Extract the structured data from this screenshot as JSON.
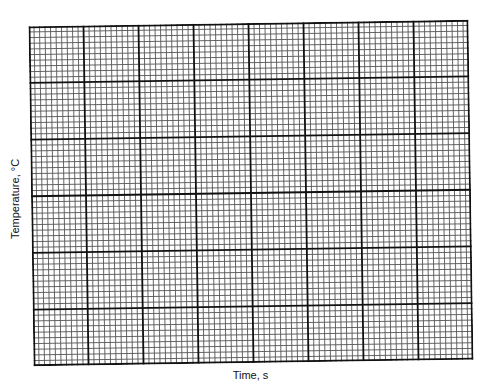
{
  "chart_data": {
    "type": "line",
    "title": "",
    "xlabel": "Time, s",
    "ylabel": "Temperature, °C",
    "grid": true,
    "grid_spec": {
      "major_columns": 8,
      "major_rows": 6,
      "minor_per_major": 10
    },
    "series": [],
    "x_ticks": [],
    "y_ticks": [],
    "legend": null
  },
  "colors": {
    "major_line": "#111111",
    "minor_line": "#555555",
    "background": "#ffffff"
  }
}
